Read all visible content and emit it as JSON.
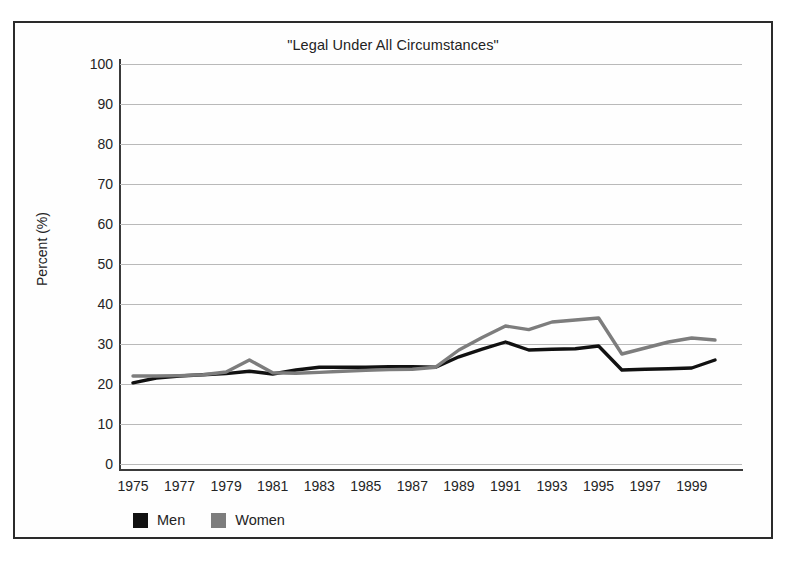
{
  "chart_data": {
    "type": "line",
    "title": "\"Legal Under All Circumstances\"",
    "xlabel": "",
    "ylabel": "Percent (%)",
    "ylim": [
      0,
      100
    ],
    "xlim": [
      1975,
      2000
    ],
    "ytick_step": 10,
    "yticks": [
      0,
      10,
      20,
      30,
      40,
      50,
      60,
      70,
      80,
      90,
      100
    ],
    "grid": "horizontal",
    "legend_position": "below-axis-left",
    "x": [
      1975,
      1976,
      1977,
      1978,
      1979,
      1980,
      1981,
      1982,
      1983,
      1984,
      1985,
      1986,
      1987,
      1988,
      1989,
      1990,
      1991,
      1992,
      1993,
      1994,
      1995,
      1996,
      1997,
      1998,
      1999,
      2000
    ],
    "xtick_labels": [
      "1975",
      "1977",
      "1979",
      "1981",
      "1983",
      "1985",
      "1987",
      "1989",
      "1991",
      "1993",
      "1995",
      "1997",
      "1999"
    ],
    "xticks": [
      1975,
      1977,
      1979,
      1981,
      1983,
      1985,
      1987,
      1989,
      1991,
      1993,
      1995,
      1997,
      1999
    ],
    "series": [
      {
        "name": "Men",
        "color": "#111111",
        "values": [
          20.3,
          21.5,
          22.0,
          22.3,
          22.6,
          23.2,
          22.5,
          23.5,
          24.2,
          24.2,
          24.2,
          24.3,
          24.3,
          24.2,
          26.8,
          28.7,
          30.5,
          28.5,
          28.7,
          28.8,
          29.5,
          23.5,
          23.7,
          23.8,
          24.0,
          26.0
        ]
      },
      {
        "name": "Women",
        "color": "#7d7d7d",
        "values": [
          22.0,
          22.0,
          22.1,
          22.3,
          23.0,
          26.0,
          22.8,
          22.7,
          22.9,
          23.2,
          23.4,
          23.6,
          23.7,
          24.2,
          28.5,
          31.6,
          34.5,
          33.6,
          35.5,
          36.0,
          36.5,
          27.5,
          29.0,
          30.5,
          31.5,
          31.0
        ]
      }
    ]
  },
  "legend": {
    "entries": [
      {
        "label": "Men",
        "color": "#111111"
      },
      {
        "label": "Women",
        "color": "#7d7d7d"
      }
    ]
  }
}
